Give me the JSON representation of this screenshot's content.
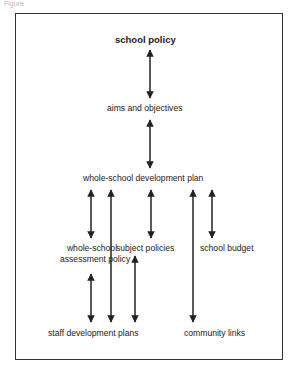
{
  "figure": {
    "caption": "Figure",
    "nodes": {
      "school_policy": "school policy",
      "aims_objectives": "aims and objectives",
      "development_plan": "whole-school development plan",
      "assessment_policy_line1": "whole-school",
      "assessment_policy_line2": "assessment policy",
      "subject_policies": "subject policies",
      "school_budget": "school budget",
      "staff_development": "staff development plans",
      "community_links": "community links"
    },
    "edges": [
      {
        "from": "school policy",
        "to": "aims and objectives",
        "type": "bidirectional"
      },
      {
        "from": "aims and objectives",
        "to": "whole-school development plan",
        "type": "bidirectional"
      },
      {
        "from": "whole-school development plan",
        "to": "whole-school assessment policy",
        "type": "bidirectional"
      },
      {
        "from": "whole-school development plan",
        "to": "staff development plans",
        "type": "bidirectional"
      },
      {
        "from": "whole-school development plan",
        "to": "subject policies",
        "type": "bidirectional"
      },
      {
        "from": "whole-school development plan",
        "to": "community links",
        "type": "bidirectional"
      },
      {
        "from": "whole-school development plan",
        "to": "school budget",
        "type": "bidirectional"
      },
      {
        "from": "whole-school assessment policy",
        "to": "staff development plans",
        "type": "bidirectional"
      },
      {
        "from": "subject policies",
        "to": "staff development plans",
        "type": "bidirectional"
      }
    ],
    "colors": {
      "line": "#222222",
      "border": "#333333",
      "background": "#ffffff"
    }
  }
}
